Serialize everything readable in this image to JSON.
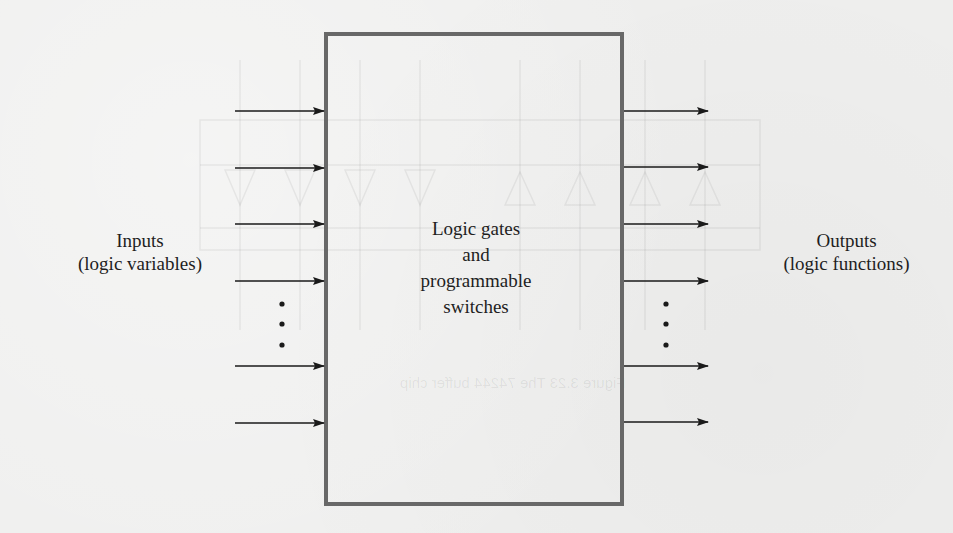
{
  "diagram": {
    "inputs_label": {
      "line1": "Inputs",
      "line2": "(logic variables)"
    },
    "outputs_label": {
      "line1": "Outputs",
      "line2": "(logic functions)"
    },
    "center_label": {
      "line1": "Logic gates",
      "line2": "and",
      "line3": "programmable",
      "line4": "switches"
    },
    "box": {
      "x": 326,
      "y": 34,
      "width": 296,
      "height": 470,
      "stroke": "#686868",
      "stroke_width": 4
    },
    "input_arrows": {
      "x_start": 235,
      "x_end": 324,
      "y": [
        111,
        168,
        224,
        281,
        366,
        423
      ],
      "color": "#1a1a1a"
    },
    "output_arrows": {
      "x_start": 624,
      "x_end": 708,
      "y": [
        111,
        167,
        224,
        281,
        366,
        422
      ],
      "color": "#1a1a1a"
    },
    "ellipsis_dots": {
      "left_x": 282,
      "right_x": 666,
      "y": [
        304,
        324,
        345
      ]
    }
  },
  "bleed_through": {
    "caption": "Figure 3.23   The 74244 buffer chip",
    "color": "#000000"
  }
}
